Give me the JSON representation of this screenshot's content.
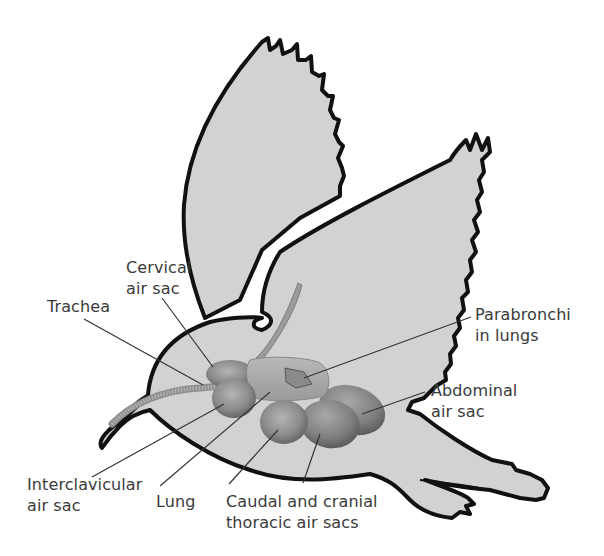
{
  "figure": {
    "colors": {
      "body_fill": "#d2d2d2",
      "outline": "#111111",
      "organ_fill": "#9a9a9a",
      "organ_dark": "#6f6f6f",
      "leader_line": "#333333",
      "label_text": "#3a3a3a"
    }
  },
  "labels": {
    "cervical": {
      "line1": "Cervical",
      "line2": "air sac"
    },
    "trachea": {
      "line1": "Trachea"
    },
    "parabronchi": {
      "line1": "Parabronchi",
      "line2": "in lungs"
    },
    "abdominal": {
      "line1": "Abdominal",
      "line2": "air sac"
    },
    "interclavicular": {
      "line1": "Interclavicular",
      "line2": "air sac"
    },
    "lung": {
      "line1": "Lung"
    },
    "thoracic": {
      "line1": "Caudal and cranial",
      "line2": "thoracic air sacs"
    }
  }
}
